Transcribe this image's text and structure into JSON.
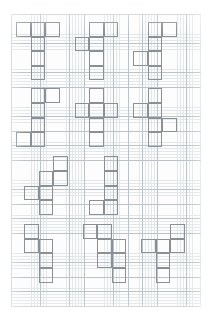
{
  "page": {
    "background_color": "#ffffff",
    "width": 211,
    "height": 320
  },
  "grid": {
    "name": "graph-paper",
    "origin_x": 11,
    "origin_y": 14,
    "width": 190,
    "height": 293,
    "major_cell_px": 14.6,
    "minor_cell_px": 2.92,
    "major_line_color": "#b9c3c9",
    "minor_line_color": "#e2e7ea",
    "paper_color": "#fdfdfd",
    "columns": 13,
    "rows": 20
  },
  "drawing": {
    "stroke_color": "#8b8f96",
    "stroke_width_px": 1.15,
    "fill": "none",
    "cell_size_px": 14.6,
    "shape_count": 12,
    "layout": "3 columns x 4 rows of hexominoes"
  },
  "chart_data": {
    "type": "table",
    "xlabel": "grid column",
    "ylabel": "grid row",
    "shapes": [
      {
        "id": 1,
        "label": "T-hexomino",
        "origin_col": 0.35,
        "origin_row": 0.55,
        "cells": [
          [
            0,
            0
          ],
          [
            1,
            0
          ],
          [
            2,
            0
          ],
          [
            1,
            1
          ],
          [
            1,
            2
          ],
          [
            1,
            3
          ]
        ]
      },
      {
        "id": 2,
        "label": "offset-cross hexomino",
        "origin_col": 4.35,
        "origin_row": 0.55,
        "cells": [
          [
            1,
            0
          ],
          [
            2,
            0
          ],
          [
            0,
            1
          ],
          [
            1,
            1
          ],
          [
            1,
            2
          ],
          [
            1,
            3
          ]
        ]
      },
      {
        "id": 3,
        "label": "Y-step hexomino",
        "origin_col": 8.35,
        "origin_row": 0.55,
        "cells": [
          [
            1,
            0
          ],
          [
            2,
            0
          ],
          [
            1,
            1
          ],
          [
            0,
            2
          ],
          [
            1,
            2
          ],
          [
            1,
            3
          ]
        ]
      },
      {
        "id": 4,
        "label": "S-step hexomino",
        "origin_col": 0.35,
        "origin_row": 5.1,
        "cells": [
          [
            1,
            0
          ],
          [
            2,
            0
          ],
          [
            1,
            1
          ],
          [
            1,
            2
          ],
          [
            0,
            3
          ],
          [
            1,
            3
          ]
        ]
      },
      {
        "id": 5,
        "label": "plus with tail hexomino",
        "origin_col": 4.35,
        "origin_row": 5.1,
        "cells": [
          [
            1,
            0
          ],
          [
            0,
            1
          ],
          [
            1,
            1
          ],
          [
            2,
            1
          ],
          [
            1,
            2
          ],
          [
            1,
            3
          ]
        ]
      },
      {
        "id": 6,
        "label": "zig cross hexomino",
        "origin_col": 8.35,
        "origin_row": 5.1,
        "cells": [
          [
            1,
            0
          ],
          [
            0,
            1
          ],
          [
            1,
            1
          ],
          [
            1,
            2
          ],
          [
            2,
            2
          ],
          [
            1,
            3
          ]
        ]
      },
      {
        "id": 7,
        "label": "W-step hexomino",
        "origin_col": 0.9,
        "origin_row": 9.75,
        "cells": [
          [
            2,
            0
          ],
          [
            1,
            1
          ],
          [
            2,
            1
          ],
          [
            0,
            2
          ],
          [
            1,
            2
          ],
          [
            1,
            3
          ]
        ]
      },
      {
        "id": 8,
        "label": "N-step hexomino",
        "origin_col": 5.35,
        "origin_row": 9.75,
        "cells": [
          [
            1,
            0
          ],
          [
            1,
            1
          ],
          [
            1,
            2
          ],
          [
            0,
            3
          ],
          [
            1,
            3
          ]
        ]
      },
      {
        "id": 9,
        "label": "vertical offset hexomino",
        "origin_col": 0.9,
        "origin_row": 14.4,
        "cells": [
          [
            0,
            0
          ],
          [
            0,
            1
          ],
          [
            1,
            1
          ],
          [
            1,
            2
          ],
          [
            1,
            3
          ]
        ]
      },
      {
        "id": 10,
        "label": "staircase hexomino",
        "origin_col": 4.9,
        "origin_row": 14.4,
        "cells": [
          [
            0,
            0
          ],
          [
            1,
            0
          ],
          [
            1,
            1
          ],
          [
            2,
            1
          ],
          [
            1,
            2
          ],
          [
            2,
            2
          ],
          [
            2,
            3
          ]
        ]
      },
      {
        "id": 11,
        "label": "L-arm hexomino",
        "origin_col": 8.9,
        "origin_row": 14.4,
        "cells": [
          [
            2,
            0
          ],
          [
            0,
            1
          ],
          [
            1,
            1
          ],
          [
            2,
            1
          ],
          [
            1,
            2
          ],
          [
            1,
            3
          ]
        ]
      }
    ]
  }
}
